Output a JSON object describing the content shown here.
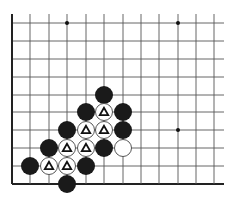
{
  "board": {
    "description": "Go board corner fragment (lower-left), 12 columns x 10 rows visible",
    "cols_x": [
      12,
      30,
      49,
      67,
      86,
      104,
      123,
      141,
      159,
      178,
      196,
      214
    ],
    "rows_y": [
      23,
      41,
      59,
      77,
      95,
      112,
      130,
      148,
      166,
      184
    ],
    "line_extent": {
      "top": 14,
      "right": 224
    },
    "edges": [
      "left",
      "bottom"
    ],
    "line_color": "#555555",
    "edge_color": "#222222",
    "star_points": [
      {
        "col": 3,
        "row": 0
      },
      {
        "col": 9,
        "row": 0
      },
      {
        "col": 9,
        "row": 6
      }
    ],
    "stone_radius": 9,
    "colors": {
      "black": "#1a1a1a",
      "white": "#ffffff",
      "marker": "#111111"
    }
  },
  "stones": [
    {
      "color": "black",
      "col": 5,
      "row": 4,
      "marker": ""
    },
    {
      "color": "black",
      "col": 4,
      "row": 5,
      "marker": ""
    },
    {
      "color": "white",
      "col": 5,
      "row": 5,
      "marker": "triangle"
    },
    {
      "color": "black",
      "col": 6,
      "row": 5,
      "marker": ""
    },
    {
      "color": "black",
      "col": 3,
      "row": 6,
      "marker": ""
    },
    {
      "color": "white",
      "col": 4,
      "row": 6,
      "marker": "triangle"
    },
    {
      "color": "white",
      "col": 5,
      "row": 6,
      "marker": "triangle"
    },
    {
      "color": "black",
      "col": 6,
      "row": 6,
      "marker": ""
    },
    {
      "color": "black",
      "col": 2,
      "row": 7,
      "marker": ""
    },
    {
      "color": "white",
      "col": 3,
      "row": 7,
      "marker": "triangle"
    },
    {
      "color": "white",
      "col": 4,
      "row": 7,
      "marker": "triangle"
    },
    {
      "color": "black",
      "col": 5,
      "row": 7,
      "marker": ""
    },
    {
      "color": "white",
      "col": 6,
      "row": 7,
      "marker": ""
    },
    {
      "color": "black",
      "col": 1,
      "row": 8,
      "marker": ""
    },
    {
      "color": "white",
      "col": 2,
      "row": 8,
      "marker": "triangle"
    },
    {
      "color": "white",
      "col": 3,
      "row": 8,
      "marker": "triangle"
    },
    {
      "color": "black",
      "col": 4,
      "row": 8,
      "marker": ""
    },
    {
      "color": "black",
      "col": 3,
      "row": 9,
      "marker": ""
    }
  ]
}
